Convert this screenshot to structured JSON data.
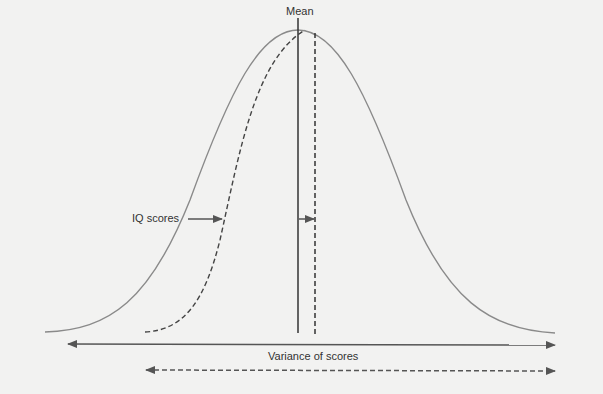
{
  "diagram": {
    "labels": {
      "mean": "Mean",
      "iq_scores": "IQ scores",
      "variance": "Variance of scores"
    },
    "colors": {
      "background": "#f2f2f1",
      "curve": "#8a8a8a",
      "line": "#333333",
      "arrow": "#555555"
    },
    "elements": [
      {
        "name": "normal-distribution-curve",
        "style": "solid"
      },
      {
        "name": "shifted-distribution-curve",
        "style": "dashed"
      },
      {
        "name": "mean-line",
        "style": "solid"
      },
      {
        "name": "shifted-mean-line",
        "style": "dashed"
      },
      {
        "name": "variance-arrow",
        "style": "solid",
        "direction": "both"
      },
      {
        "name": "reduced-variance-arrow",
        "style": "dashed",
        "direction": "both"
      }
    ]
  }
}
